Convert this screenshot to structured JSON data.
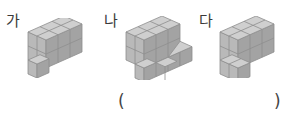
{
  "figures": [
    {
      "id": "ga",
      "label": "가"
    },
    {
      "id": "na",
      "label": "나"
    },
    {
      "id": "da",
      "label": "다"
    }
  ],
  "answer_blank": {
    "open": "(",
    "close": ")"
  },
  "colors": {
    "top": "#cfcfcf",
    "front": "#b9b9b9",
    "side": "#a3a3a3",
    "edge": "#8e8e8e",
    "label": "#3a3a3a"
  }
}
